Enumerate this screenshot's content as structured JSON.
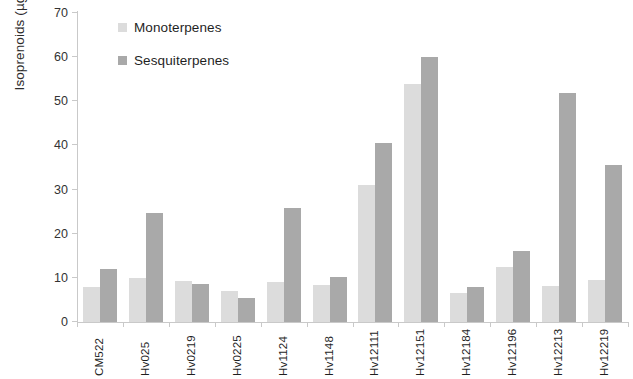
{
  "chart_data": {
    "type": "bar",
    "title": "",
    "xlabel": "",
    "ylabel": "Isoprenoids (µg/L)",
    "ylim": [
      0,
      70
    ],
    "yticks": [
      0,
      10,
      20,
      30,
      40,
      50,
      60,
      70
    ],
    "grid": false,
    "legend_position": "upper-left-inside",
    "categories": [
      "CM522",
      "Hv025",
      "Hv0219",
      "Hv0225",
      "Hv1124",
      "Hv1148",
      "Hv12111",
      "Hv12151",
      "Hv12184",
      "Hv12196",
      "Hv12213",
      "Hv12219"
    ],
    "series": [
      {
        "name": "Monoterpenes",
        "color": "#dcdcdc",
        "values": [
          8.0,
          10.0,
          9.3,
          7.0,
          9.0,
          8.3,
          31.0,
          54.0,
          6.5,
          12.5,
          8.2,
          9.5
        ]
      },
      {
        "name": "Sesquiterpenes",
        "color": "#a9a9a9",
        "values": [
          12.0,
          24.8,
          8.5,
          5.5,
          25.8,
          10.3,
          40.6,
          60.0,
          8.0,
          16.0,
          51.8,
          35.5
        ]
      }
    ]
  }
}
